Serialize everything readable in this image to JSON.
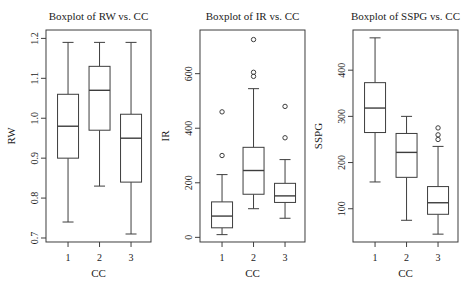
{
  "figure": {
    "type": "r-base-boxplot-row",
    "background": "#ffffff"
  },
  "colors": {
    "background": "#ffffff",
    "line": "#3d3d3d",
    "text": "#1c1c1c",
    "box_fill": "#ffffff"
  },
  "chart_data": [
    {
      "type": "boxplot",
      "title": "Boxplot of RW vs. CC",
      "xlabel": "CC",
      "ylabel": "RW",
      "categories": [
        "1",
        "2",
        "3"
      ],
      "ylim": [
        0.69,
        1.221
      ],
      "yticks": [
        0.7,
        0.8,
        0.9,
        1.0,
        1.1,
        1.2
      ],
      "ytick_labels": [
        "0.7",
        "0.8",
        "0.9",
        "1.0",
        "1.1",
        "1.2"
      ],
      "grid": false,
      "boxes": [
        {
          "category": "1",
          "whisker_low": 0.74,
          "q1": 0.9,
          "median": 0.98,
          "q3": 1.06,
          "whisker_high": 1.19,
          "outliers": []
        },
        {
          "category": "2",
          "whisker_low": 0.83,
          "q1": 0.97,
          "median": 1.07,
          "q3": 1.13,
          "whisker_high": 1.19,
          "outliers": []
        },
        {
          "category": "3",
          "whisker_low": 0.71,
          "q1": 0.84,
          "median": 0.95,
          "q3": 1.01,
          "whisker_high": 1.19,
          "outliers": []
        }
      ]
    },
    {
      "type": "boxplot",
      "title": "Boxplot of IR vs. CC",
      "xlabel": "CC",
      "ylabel": "IR",
      "categories": [
        "1",
        "2",
        "3"
      ],
      "ylim": [
        -17,
        760
      ],
      "yticks": [
        0,
        200,
        400,
        600
      ],
      "ytick_labels": [
        "0",
        "200",
        "400",
        "600"
      ],
      "grid": false,
      "boxes": [
        {
          "category": "1",
          "whisker_low": 10,
          "q1": 35,
          "median": 78,
          "q3": 130,
          "whisker_high": 230,
          "outliers": [
            300,
            460
          ]
        },
        {
          "category": "2",
          "whisker_low": 105,
          "q1": 158,
          "median": 245,
          "q3": 330,
          "whisker_high": 545,
          "outliers": [
            590,
            605,
            725
          ]
        },
        {
          "category": "3",
          "whisker_low": 70,
          "q1": 128,
          "median": 152,
          "q3": 198,
          "whisker_high": 285,
          "outliers": [
            365,
            480
          ]
        }
      ]
    },
    {
      "type": "boxplot",
      "title": "Boxplot of SSPG vs. CC",
      "xlabel": "CC",
      "ylabel": "SSPG",
      "categories": [
        "1",
        "2",
        "3"
      ],
      "ylim": [
        28,
        487
      ],
      "yticks": [
        100,
        200,
        300,
        400
      ],
      "ytick_labels": [
        "100",
        "200",
        "300",
        "400"
      ],
      "grid": false,
      "boxes": [
        {
          "category": "1",
          "whisker_low": 158,
          "q1": 265,
          "median": 318,
          "q3": 373,
          "whisker_high": 470,
          "outliers": []
        },
        {
          "category": "2",
          "whisker_low": 75,
          "q1": 168,
          "median": 222,
          "q3": 263,
          "whisker_high": 300,
          "outliers": []
        },
        {
          "category": "3",
          "whisker_low": 45,
          "q1": 88,
          "median": 113,
          "q3": 148,
          "whisker_high": 235,
          "outliers": [
            250,
            260,
            275
          ]
        }
      ]
    }
  ]
}
